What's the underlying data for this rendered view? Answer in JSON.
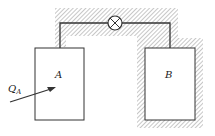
{
  "diagram": {
    "type": "thermodynamics-two-tank-system",
    "labels": {
      "tank_a": "A",
      "tank_b": "B",
      "heat_symbol": "Q",
      "heat_subscript": "A"
    },
    "components": {
      "tank_a": {
        "insulated": false
      },
      "tank_b": {
        "insulated": true
      },
      "connecting_pipe": {
        "insulated": true
      },
      "valve": {
        "symbol": "circle-with-x"
      }
    },
    "colors": {
      "line": "#333333",
      "hatch": "#9a9a9a",
      "background": "#ffffff"
    }
  }
}
